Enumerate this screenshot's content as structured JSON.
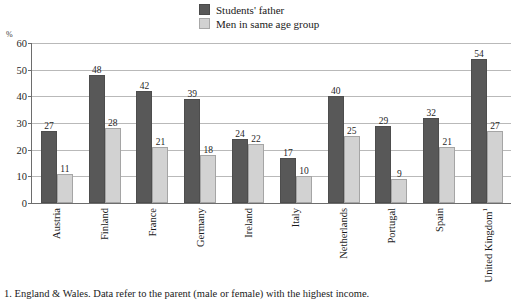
{
  "legend": {
    "items": [
      {
        "label": "Students' father",
        "color": "#585858",
        "key": "students_father"
      },
      {
        "label": "Men in same age group",
        "color": "#d2d2d2",
        "key": "men_same_age"
      }
    ]
  },
  "axis": {
    "unit": "%",
    "y_ticks": [
      "0",
      "10",
      "20",
      "30",
      "40",
      "50",
      "60"
    ]
  },
  "footnote": "1. England & Wales. Data refer to the parent (male or female) with the highest income.",
  "chart_data": {
    "type": "bar",
    "title": "",
    "xlabel": "",
    "ylabel": "%",
    "ylim": [
      0,
      60
    ],
    "ytick_step": 10,
    "grid": true,
    "legend_position": "top-center",
    "categories": [
      "Austria",
      "Finland",
      "France",
      "Germany",
      "Ireland",
      "Italy",
      "Netherlands",
      "Portugal",
      "Spain",
      "United Kingdom"
    ],
    "category_footnote_markers": [
      "",
      "",
      "",
      "",
      "",
      "",
      "",
      "",
      "",
      "1"
    ],
    "series": [
      {
        "name": "Students' father",
        "color": "#585858",
        "values": [
          27,
          48,
          42,
          39,
          24,
          17,
          40,
          29,
          32,
          54
        ]
      },
      {
        "name": "Men in same age group",
        "color": "#d2d2d2",
        "values": [
          11,
          28,
          21,
          18,
          22,
          10,
          25,
          9,
          21,
          27
        ]
      }
    ]
  }
}
